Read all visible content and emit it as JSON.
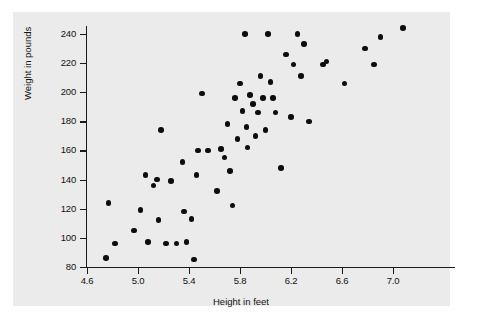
{
  "chart_data": {
    "type": "scatter",
    "title": "",
    "xlabel": "Height in feet",
    "ylabel": "Weight in pounds",
    "xlim": [
      4.6,
      7.2
    ],
    "ylim": [
      80,
      248
    ],
    "xticks": [
      "4.6",
      "5.0",
      "5.4",
      "5.8",
      "6.2",
      "6.6",
      "7.0"
    ],
    "xtick_values": [
      4.6,
      5.0,
      5.4,
      5.8,
      6.2,
      6.6,
      7.0
    ],
    "yticks": [
      "80",
      "100",
      "120",
      "140",
      "160",
      "180",
      "200",
      "220",
      "240"
    ],
    "ytick_values": [
      80,
      100,
      120,
      140,
      160,
      180,
      200,
      220,
      240
    ],
    "grid": false,
    "legend": null,
    "marker": "filled-circle",
    "marker_color": "#0d0d0d",
    "panel_color": "#ebebeb",
    "background_color": "#ffffff",
    "points": [
      [
        4.75,
        86
      ],
      [
        4.82,
        96
      ],
      [
        4.77,
        124
      ],
      [
        4.97,
        105
      ],
      [
        5.02,
        119
      ],
      [
        5.06,
        143
      ],
      [
        5.08,
        97
      ],
      [
        5.12,
        136
      ],
      [
        5.15,
        140
      ],
      [
        5.16,
        112
      ],
      [
        5.18,
        174
      ],
      [
        5.22,
        96
      ],
      [
        5.26,
        139
      ],
      [
        5.3,
        96
      ],
      [
        5.35,
        152
      ],
      [
        5.36,
        118
      ],
      [
        5.38,
        97
      ],
      [
        5.42,
        113
      ],
      [
        5.44,
        85
      ],
      [
        5.46,
        143
      ],
      [
        5.47,
        160
      ],
      [
        5.5,
        199
      ],
      [
        5.55,
        160
      ],
      [
        5.62,
        132
      ],
      [
        5.65,
        161
      ],
      [
        5.68,
        155
      ],
      [
        5.7,
        178
      ],
      [
        5.72,
        146
      ],
      [
        5.74,
        122
      ],
      [
        5.76,
        196
      ],
      [
        5.78,
        168
      ],
      [
        5.8,
        206
      ],
      [
        5.82,
        187
      ],
      [
        5.84,
        240
      ],
      [
        5.85,
        176
      ],
      [
        5.86,
        162
      ],
      [
        5.88,
        198
      ],
      [
        5.9,
        192
      ],
      [
        5.92,
        170
      ],
      [
        5.94,
        186
      ],
      [
        5.96,
        211
      ],
      [
        5.98,
        196
      ],
      [
        6.0,
        174
      ],
      [
        6.02,
        240
      ],
      [
        6.04,
        207
      ],
      [
        6.06,
        196
      ],
      [
        6.08,
        186
      ],
      [
        6.12,
        148
      ],
      [
        6.16,
        226
      ],
      [
        6.2,
        183
      ],
      [
        6.22,
        219
      ],
      [
        6.25,
        240
      ],
      [
        6.28,
        211
      ],
      [
        6.3,
        233
      ],
      [
        6.34,
        180
      ],
      [
        6.45,
        219
      ],
      [
        6.48,
        221
      ],
      [
        6.62,
        206
      ],
      [
        6.78,
        230
      ],
      [
        6.85,
        219
      ],
      [
        6.9,
        238
      ],
      [
        7.08,
        244
      ]
    ]
  }
}
